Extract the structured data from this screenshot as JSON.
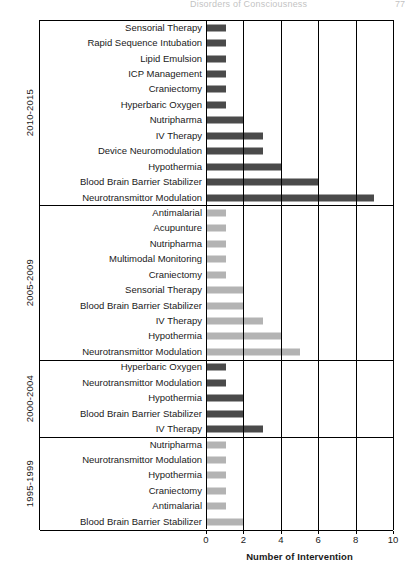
{
  "header": {
    "title": "Disorders of Consciousness",
    "page_number": "77"
  },
  "chart_data": {
    "type": "bar",
    "orientation": "horizontal",
    "title": "",
    "xlabel": "Number of Intervention",
    "ylabel": "",
    "xlim": [
      0,
      10
    ],
    "xticks": [
      "0",
      "2",
      "4",
      "6",
      "8",
      "10"
    ],
    "grid": "vertical",
    "legend": "none",
    "colors": {
      "dark": "#4a4a4a",
      "light": "#b3b3b3",
      "axis": "#000000"
    },
    "groups": [
      {
        "name": "2010-2015",
        "color": "#4a4a4a",
        "categories": [
          "Sensorial Therapy",
          "Rapid Sequence Intubation",
          "Lipid Emulsion",
          "ICP Management",
          "Craniectomy",
          "Hyperbaric Oxygen",
          "Nutripharma",
          "IV Therapy",
          "Device Neuromodulation",
          "Hypothermia",
          "Blood Brain Barrier Stabilizer",
          "Neurotransmittor Modulation"
        ],
        "values": [
          1,
          1,
          1,
          1,
          1,
          1,
          2,
          3,
          3,
          4,
          6,
          9
        ]
      },
      {
        "name": "2005-2009",
        "color": "#b3b3b3",
        "categories": [
          "Antimalarial",
          "Acupunture",
          "Nutripharma",
          "Multimodal Monitoring",
          "Craniectomy",
          "Sensorial Therapy",
          "Blood Brain Barrier Stabilizer",
          "IV Therapy",
          "Hypothermia",
          "Neurotransmittor Modulation"
        ],
        "values": [
          1,
          1,
          1,
          1,
          1,
          2,
          2,
          3,
          4,
          5
        ]
      },
      {
        "name": "2000-2004",
        "color": "#4a4a4a",
        "categories": [
          "Hyperbaric Oxygen",
          "Neurotransmittor Modulation",
          "Hypothermia",
          "Blood Brain Barrier Stabilizer",
          "IV Therapy"
        ],
        "values": [
          1,
          1,
          2,
          2,
          3
        ]
      },
      {
        "name": "1995-1999",
        "color": "#b3b3b3",
        "categories": [
          "Nutripharma",
          "Neurotransmittor Modulation",
          "Hypothermia",
          "Craniectomy",
          "Antimalarial",
          "Blood Brain Barrier Stabilizer"
        ],
        "values": [
          1,
          1,
          1,
          1,
          1,
          2
        ]
      }
    ]
  }
}
